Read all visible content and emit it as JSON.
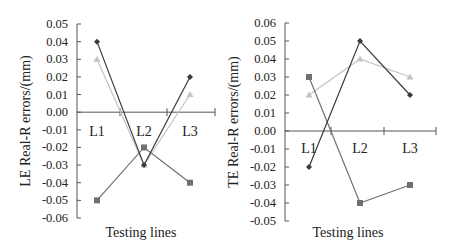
{
  "chart_data": [
    {
      "type": "line",
      "title": "",
      "xlabel": "Testing lines",
      "ylabel": "LE Real-R errors/(mm)",
      "categories": [
        "L1",
        "L2",
        "L3"
      ],
      "ylim": [
        -0.06,
        0.05
      ],
      "yticks": [
        "0.05",
        "0.04",
        "0.03",
        "0.02",
        "0.01",
        "0.00",
        "-0.01",
        "-0.02",
        "-0.03",
        "-0.04",
        "-0.05",
        "-0.06"
      ],
      "grid": false,
      "legend": "none",
      "series": [
        {
          "name": "series-diamond",
          "marker": "diamond",
          "color": "#3a3a3a",
          "values": [
            0.04,
            -0.03,
            0.02
          ]
        },
        {
          "name": "series-square",
          "marker": "square",
          "color": "#707070",
          "values": [
            -0.05,
            -0.02,
            -0.04
          ]
        },
        {
          "name": "series-triangle",
          "marker": "triangle",
          "color": "#c4c4c4",
          "values": [
            0.03,
            -0.03,
            0.01
          ]
        }
      ]
    },
    {
      "type": "line",
      "title": "",
      "xlabel": "Testing lines",
      "ylabel": "TE Real-R errors/(mm)",
      "categories": [
        "L1",
        "L2",
        "L3"
      ],
      "ylim": [
        -0.05,
        0.06
      ],
      "yticks": [
        "0.06",
        "0.05",
        "0.04",
        "0.03",
        "0.02",
        "0.01",
        "0.00",
        "-0.01",
        "-0.02",
        "-0.03",
        "-0.04",
        "-0.05"
      ],
      "grid": false,
      "legend": "none",
      "series": [
        {
          "name": "series-diamond",
          "marker": "diamond",
          "color": "#3a3a3a",
          "values": [
            -0.02,
            0.05,
            0.02
          ]
        },
        {
          "name": "series-square",
          "marker": "square",
          "color": "#707070",
          "values": [
            0.03,
            -0.04,
            -0.03
          ]
        },
        {
          "name": "series-triangle",
          "marker": "triangle",
          "color": "#c4c4c4",
          "values": [
            0.02,
            0.04,
            0.03
          ]
        }
      ]
    }
  ]
}
